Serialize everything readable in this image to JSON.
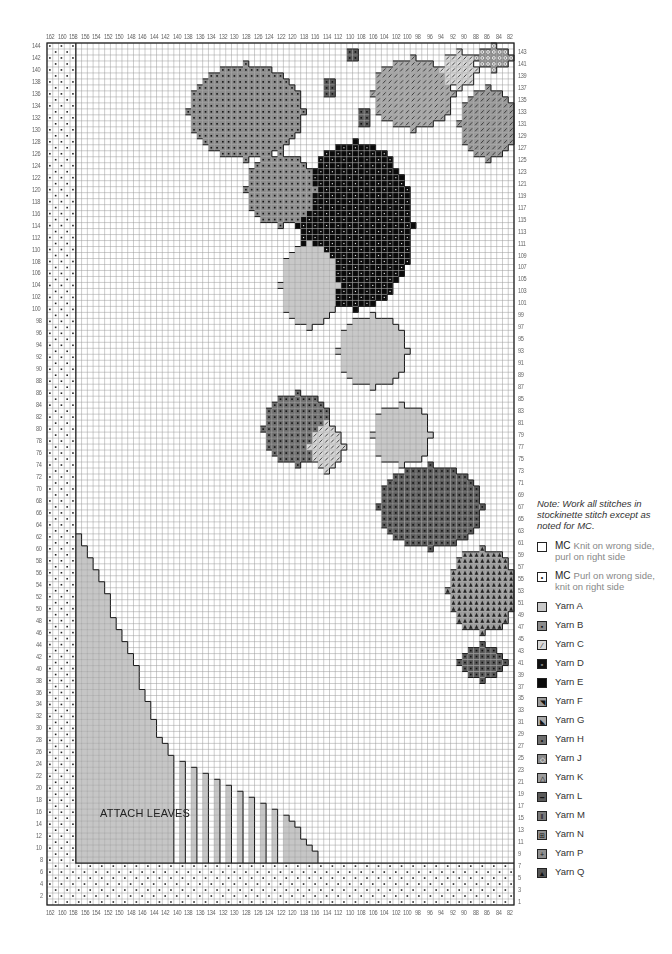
{
  "chart_data": {
    "type": "knitting-chart",
    "title": "",
    "columns": {
      "from": 162,
      "to": 82,
      "count": 81,
      "top_labels_step": 2,
      "labels": [
        162,
        160,
        158,
        156,
        154,
        152,
        150,
        148,
        146,
        144,
        142,
        140,
        138,
        136,
        134,
        132,
        130,
        128,
        126,
        124,
        122,
        120,
        118,
        116,
        114,
        112,
        110,
        108,
        106,
        104,
        102,
        100,
        98,
        96,
        94,
        92,
        90,
        88,
        86,
        84,
        82
      ]
    },
    "rows": {
      "from": 1,
      "to": 144,
      "count": 144,
      "left_labels": "even 2-144",
      "right_labels": "odd 1-143"
    },
    "regions": {
      "mc_purl_border_left_cols": [
        162,
        158
      ],
      "mc_purl_border_bottom_rows": [
        1,
        7
      ],
      "attach_leaves_triangle_staircase": [
        [
          157,
          62
        ],
        [
          156,
          60
        ],
        [
          155,
          58
        ],
        [
          154,
          56
        ],
        [
          153,
          54
        ],
        [
          152,
          52
        ],
        [
          151,
          48
        ],
        [
          150,
          46
        ],
        [
          149,
          44
        ],
        [
          148,
          42
        ],
        [
          147,
          40
        ],
        [
          146,
          36
        ],
        [
          145,
          34
        ],
        [
          144,
          31
        ],
        [
          143,
          28
        ],
        [
          142,
          27
        ],
        [
          141,
          25
        ],
        [
          139,
          24
        ],
        [
          137,
          23
        ],
        [
          135,
          22
        ],
        [
          133,
          21
        ],
        [
          131,
          20
        ],
        [
          129,
          19
        ],
        [
          127,
          18
        ],
        [
          125,
          17
        ],
        [
          123,
          16
        ],
        [
          121,
          15
        ],
        [
          120,
          14
        ],
        [
          119,
          13
        ],
        [
          118,
          11
        ],
        [
          117,
          10
        ],
        [
          116,
          9
        ]
      ]
    },
    "blobs": [
      {
        "yarn": "L",
        "shape": [
          [
            110,
            143,
            2
          ],
          [
            114,
            138,
            3
          ],
          [
            108,
            133,
            3
          ]
        ]
      },
      {
        "yarn": "E",
        "cx": 109,
        "cy": 114,
        "rx": 10,
        "ry": 14
      },
      {
        "yarn": "B",
        "cx": 128,
        "cy": 133,
        "rx": 10,
        "ry": 8
      },
      {
        "yarn": "B",
        "cx": 122,
        "cy": 120,
        "rx": 6,
        "ry": 6
      },
      {
        "yarn": "G",
        "cx": 99,
        "cy": 136,
        "rx": 7,
        "ry": 6
      },
      {
        "yarn": "F",
        "cx": 86,
        "cy": 131,
        "rx": 5,
        "ry": 6
      },
      {
        "yarn": "C",
        "cx": 91,
        "cy": 140,
        "rx": 3,
        "ry": 3
      },
      {
        "yarn": "J",
        "cx": 85,
        "cy": 142,
        "rx": 3,
        "ry": 2
      },
      {
        "yarn": "A",
        "cx": 117,
        "cy": 104,
        "rx": 5,
        "ry": 7
      },
      {
        "yarn": "A",
        "cx": 106,
        "cy": 93,
        "rx": 6,
        "ry": 6
      },
      {
        "yarn": "A",
        "cx": 101,
        "cy": 79,
        "rx": 5,
        "ry": 5
      },
      {
        "yarn": "L",
        "cx": 96,
        "cy": 67,
        "rx": 9,
        "ry": 7
      },
      {
        "yarn": "K",
        "cx": 87,
        "cy": 53,
        "rx": 6,
        "ry": 7
      },
      {
        "yarn": "L",
        "cx": 87,
        "cy": 41,
        "rx": 4,
        "ry": 3
      },
      {
        "yarn": "H",
        "cx": 119,
        "cy": 80,
        "rx": 6,
        "ry": 6
      },
      {
        "yarn": "C",
        "cx": 114,
        "cy": 77,
        "rx": 3,
        "ry": 4
      }
    ]
  },
  "chart": {
    "annotation": "ATTACH LEAVES"
  },
  "legend": {
    "note": "Note: Work all stitches in stockinette stitch except as noted for MC.",
    "items": [
      {
        "key": "MC",
        "label": "MC",
        "desc": "Knit on wrong side, purl on right side",
        "symbol": "empty",
        "fill": "#ffffff"
      },
      {
        "key": "MC2",
        "label": "MC",
        "desc": "Purl on wrong side, knit on right side",
        "symbol": "dot",
        "fill": "#ffffff"
      },
      {
        "key": "A",
        "label": "Yarn A",
        "desc": "",
        "symbol": "none",
        "fill": "#c8c8c8"
      },
      {
        "key": "B",
        "label": "Yarn B",
        "desc": "",
        "symbol": "dot-square",
        "fill": "#8c8c8c"
      },
      {
        "key": "C",
        "label": "Yarn C",
        "desc": "",
        "symbol": "slash",
        "fill": "#d8d8d8"
      },
      {
        "key": "D",
        "label": "Yarn D",
        "desc": "",
        "symbol": "white-square",
        "fill": "#111111"
      },
      {
        "key": "E",
        "label": "Yarn E",
        "desc": "",
        "symbol": "none",
        "fill": "#0a0a0a"
      },
      {
        "key": "F",
        "label": "Yarn F",
        "desc": "",
        "symbol": "triangle-corner",
        "fill": "#9a9a9a"
      },
      {
        "key": "G",
        "label": "Yarn G",
        "desc": "",
        "symbol": "small-corner",
        "fill": "#a8a8a8"
      },
      {
        "key": "H",
        "label": "Yarn H",
        "desc": "",
        "symbol": "dot",
        "fill": "#6e6e6e"
      },
      {
        "key": "J",
        "label": "Yarn J",
        "desc": "",
        "symbol": "circle",
        "fill": "#8a8a8a"
      },
      {
        "key": "K",
        "label": "Yarn K",
        "desc": "",
        "symbol": "triangle",
        "fill": "#9c9c9c"
      },
      {
        "key": "L",
        "label": "Yarn L",
        "desc": "",
        "symbol": "dash",
        "fill": "#5a5a5a"
      },
      {
        "key": "M",
        "label": "Yarn M",
        "desc": "",
        "symbol": "double-bar",
        "fill": "#7a7a7a"
      },
      {
        "key": "N",
        "label": "Yarn N",
        "desc": "",
        "symbol": "grid4",
        "fill": "#909090"
      },
      {
        "key": "P",
        "label": "Yarn P",
        "desc": "",
        "symbol": "plus",
        "fill": "#8f8f8f"
      },
      {
        "key": "Q",
        "label": "Yarn Q",
        "desc": "",
        "symbol": "solid-triangle",
        "fill": "#555555"
      }
    ]
  }
}
